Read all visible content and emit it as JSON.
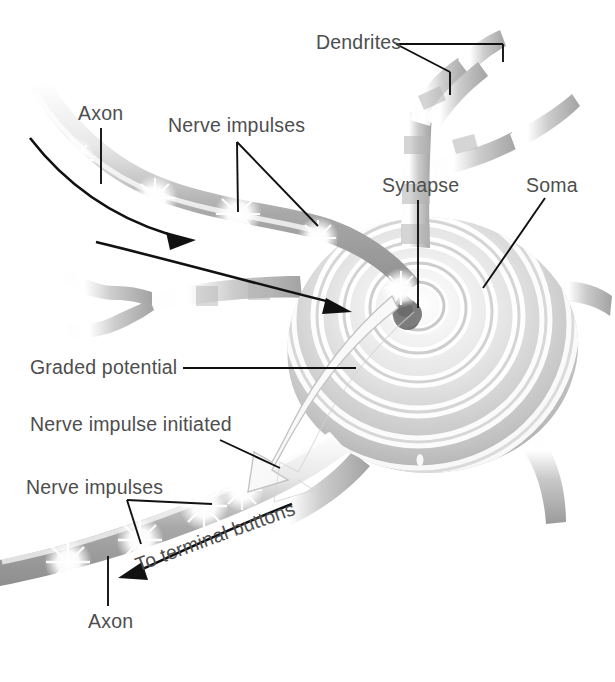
{
  "figure": {
    "background_color": "#ffffff",
    "label_color": "#4e4e4e",
    "leader_line_color": "#111111"
  },
  "labels": {
    "dendrites": "Dendrites",
    "axon_top": "Axon",
    "nerve_impulses_top": "Nerve impulses",
    "synapse": "Synapse",
    "soma": "Soma",
    "graded_potential": "Graded potential",
    "nerve_impulse_initiated": "Nerve impulse initiated",
    "nerve_impulses_bottom": "Nerve impulses",
    "to_terminal_buttons": "To terminal buttons",
    "axon_bottom": "Axon"
  },
  "parts": {
    "soma_name": "soma-cell-body",
    "nucleus_name": "synapse-terminal-button",
    "ripple_count": 7,
    "graded_potential_arrow": "white-curved-arrow",
    "impulse_flash_count_top": 3,
    "impulse_flash_count_bottom": 4,
    "direction_arrow_top": "impulse-direction-arrow-toward-soma",
    "direction_arrow_bottom": "impulse-direction-arrow-to-terminal-buttons"
  }
}
